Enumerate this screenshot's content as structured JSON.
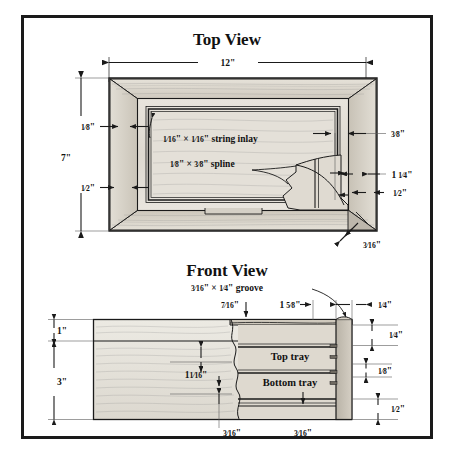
{
  "figure": {
    "kind": "woodworking-plan",
    "border_color": "#1a1a1a",
    "background": "#ffffff"
  },
  "top_view": {
    "title": "Top View",
    "width_label": "12\"",
    "height_label": "7\"",
    "left_top_label_num": "1",
    "left_top_label_den": "8",
    "left_top_label": "1/8\"",
    "left_bottom_label": "1/2\"",
    "right_top_label": "3/8\"",
    "right_mid_label_whole": "1",
    "right_mid_label": "1 1/4\"",
    "right_bottom_label": "1/2\"",
    "corner_label": "3/16\"",
    "note_inlay": "string inlay",
    "note_inlay_dim_a": "1/16\"",
    "note_inlay_dim_b": "1/16\"",
    "note_spline": "spline",
    "note_spline_dim_a": "1/8\"",
    "note_spline_dim_b": "3/8\"",
    "times": "×"
  },
  "front_view": {
    "title": "Front View",
    "groove_note": "groove",
    "groove_dim_a": "3/16\"",
    "groove_dim_b": "1/4\"",
    "left_top_label": "1\"",
    "left_bottom_label": "3\"",
    "top_label_a": "7/16\"",
    "top_label_b": "1 5/8\"",
    "top_label_c": "1/4\"",
    "right_label_1": "1/4\"",
    "right_label_2": "1/8\"",
    "right_label_3": "1/2\"",
    "inner_label": "1 1/16\"",
    "bottom_label_a": "3/16\"",
    "bottom_label_b": "3/16\"",
    "tray_top": "Top tray",
    "tray_bottom": "Bottom tray",
    "times": "×"
  },
  "fractions": {
    "one_sixteenth": {
      "n": "1",
      "d": "16"
    },
    "one_eighth": {
      "n": "1",
      "d": "8"
    },
    "three_eighths": {
      "n": "3",
      "d": "8"
    },
    "one_half": {
      "n": "1",
      "d": "2"
    },
    "one_quarter": {
      "n": "1",
      "d": "4"
    },
    "three_sixteenths": {
      "n": "3",
      "d": "16"
    },
    "five_eighths": {
      "n": "5",
      "d": "8"
    },
    "seven_sixteenths": {
      "n": "7",
      "d": "16"
    }
  },
  "colors": {
    "line": "#1a1a1a",
    "wood_light": "#e9e5dd",
    "wood_mid": "#d8d3c9",
    "wood_dark": "#c2bcb0",
    "wood_shadow": "#a9a299",
    "wood_deep": "#8e877d"
  }
}
